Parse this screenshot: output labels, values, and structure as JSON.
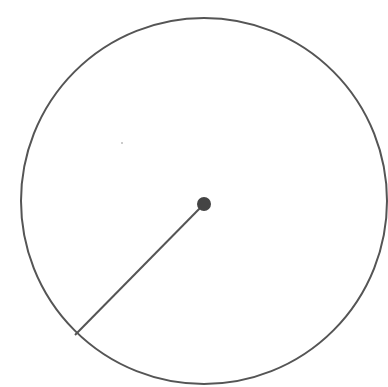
{
  "diagram": {
    "type": "circle-with-radius",
    "circle": {
      "cx": 204,
      "cy": 201,
      "r": 183,
      "stroke": "#555555",
      "stroke_width": 2
    },
    "center_point": {
      "cx": 204,
      "cy": 204,
      "r": 7,
      "fill": "#444444"
    },
    "radius_line": {
      "x1": 204,
      "y1": 204,
      "x2": 75,
      "y2": 335,
      "stroke": "#555555",
      "stroke_width": 2
    },
    "speck": {
      "cx": 122,
      "cy": 143,
      "r": 1,
      "fill": "#bbbbbb"
    }
  }
}
